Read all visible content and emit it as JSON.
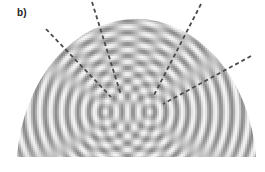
{
  "figure": {
    "panel_label": "b)",
    "background_color": "#ffffff",
    "wave_light": "#f4f4f4",
    "wave_dark": "#8a8a8a",
    "line_color": "#4a4a4a",
    "dome": {
      "cx": 136,
      "cy": 157,
      "rx": 120,
      "ry": 152,
      "flat_bottom_y": 157,
      "left_x": 17,
      "right_x": 256
    },
    "sources": [
      {
        "x": 105,
        "y": 112
      },
      {
        "x": 150,
        "y": 112
      }
    ],
    "wavelength": 11,
    "dashed_lines": [
      {
        "x1": 46,
        "y1": 29,
        "x2": 111,
        "y2": 97
      },
      {
        "x1": 92,
        "y1": 2,
        "x2": 121,
        "y2": 95
      },
      {
        "x1": 201,
        "y1": 4,
        "x2": 153,
        "y2": 97
      },
      {
        "x1": 251,
        "y1": 56,
        "x2": 163,
        "y2": 104
      }
    ]
  }
}
